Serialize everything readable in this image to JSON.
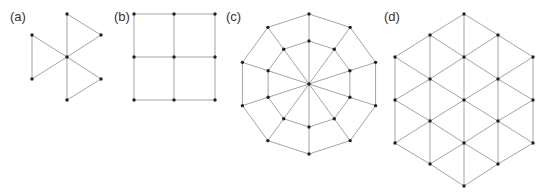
{
  "style": {
    "edge_color": "#9a9a9a",
    "node_color": "#222222",
    "label_color": "#333333",
    "background": "#ffffff"
  },
  "panels": [
    {
      "id": "a",
      "label": "(a)",
      "label_pos": [
        10,
        21
      ],
      "description": "Center node connected to 6 outer nodes forming 3 triangles (windmill)",
      "nodes": [
        [
          67,
          57
        ],
        [
          67,
          14
        ],
        [
          101,
          35
        ],
        [
          101,
          79
        ],
        [
          67,
          100
        ],
        [
          32,
          79
        ],
        [
          32,
          35
        ]
      ],
      "edges": [
        [
          0,
          1
        ],
        [
          0,
          2
        ],
        [
          0,
          3
        ],
        [
          0,
          4
        ],
        [
          0,
          5
        ],
        [
          0,
          6
        ],
        [
          1,
          2
        ],
        [
          3,
          4
        ],
        [
          5,
          6
        ]
      ]
    },
    {
      "id": "b",
      "label": "(b)",
      "label_pos": [
        114,
        21
      ],
      "description": "3x3 square grid",
      "nodes": [
        [
          134,
          14
        ],
        [
          174,
          14
        ],
        [
          215,
          14
        ],
        [
          134,
          57
        ],
        [
          174,
          57
        ],
        [
          215,
          57
        ],
        [
          134,
          100
        ],
        [
          174,
          100
        ],
        [
          215,
          100
        ]
      ],
      "edges": [
        [
          0,
          1
        ],
        [
          1,
          2
        ],
        [
          3,
          4
        ],
        [
          4,
          5
        ],
        [
          6,
          7
        ],
        [
          7,
          8
        ],
        [
          0,
          3
        ],
        [
          3,
          6
        ],
        [
          1,
          4
        ],
        [
          4,
          7
        ],
        [
          2,
          5
        ],
        [
          5,
          8
        ]
      ]
    },
    {
      "id": "c",
      "label": "(c)",
      "label_pos": [
        226,
        21
      ],
      "description": "Two concentric decagons with 10 spokes from center",
      "center": [
        309,
        84
      ],
      "outer_radius": 70,
      "inner_radius": 43,
      "sides": 10
    },
    {
      "id": "d",
      "label": "(d)",
      "label_pos": [
        384,
        21
      ],
      "description": "Hexagonal patch of triangular lattice",
      "nodes": [
        [
          395,
          57
        ],
        [
          395,
          100
        ],
        [
          395,
          143
        ],
        [
          430,
          35
        ],
        [
          430,
          79
        ],
        [
          430,
          121
        ],
        [
          430,
          164
        ],
        [
          464,
          14
        ],
        [
          464,
          57
        ],
        [
          464,
          100
        ],
        [
          464,
          143
        ],
        [
          464,
          186
        ],
        [
          498,
          35
        ],
        [
          498,
          79
        ],
        [
          498,
          121
        ],
        [
          498,
          164
        ],
        [
          533,
          57
        ],
        [
          533,
          100
        ],
        [
          533,
          143
        ]
      ],
      "edges": [
        [
          0,
          1
        ],
        [
          1,
          2
        ],
        [
          3,
          4
        ],
        [
          4,
          5
        ],
        [
          5,
          6
        ],
        [
          7,
          8
        ],
        [
          8,
          9
        ],
        [
          9,
          10
        ],
        [
          10,
          11
        ],
        [
          12,
          13
        ],
        [
          13,
          14
        ],
        [
          14,
          15
        ],
        [
          16,
          17
        ],
        [
          17,
          18
        ],
        [
          0,
          3
        ],
        [
          0,
          4
        ],
        [
          1,
          4
        ],
        [
          1,
          5
        ],
        [
          2,
          5
        ],
        [
          2,
          6
        ],
        [
          3,
          7
        ],
        [
          3,
          8
        ],
        [
          4,
          8
        ],
        [
          4,
          9
        ],
        [
          5,
          9
        ],
        [
          5,
          10
        ],
        [
          6,
          10
        ],
        [
          6,
          11
        ],
        [
          7,
          12
        ],
        [
          8,
          12
        ],
        [
          8,
          13
        ],
        [
          9,
          13
        ],
        [
          9,
          14
        ],
        [
          10,
          14
        ],
        [
          10,
          15
        ],
        [
          11,
          15
        ],
        [
          12,
          16
        ],
        [
          13,
          16
        ],
        [
          13,
          17
        ],
        [
          14,
          17
        ],
        [
          14,
          18
        ],
        [
          15,
          18
        ]
      ]
    }
  ]
}
